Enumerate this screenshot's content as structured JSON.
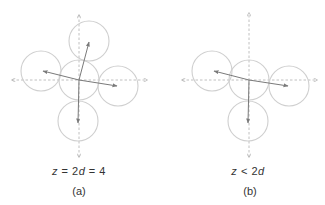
{
  "colors": {
    "axis": "#b0b0b0",
    "circle": "#cfcfcf",
    "arrow": "#7a7a7a",
    "text": "#333333"
  },
  "panels": [
    {
      "id": "a",
      "caption": "(a)",
      "equation": "z  =  2d  =  4",
      "equation_parts": [
        "z",
        " = ",
        "2",
        "d",
        " = ",
        "4"
      ],
      "axes": {
        "cx": 79,
        "cy": 80,
        "x_min": 12,
        "x_max": 147,
        "y_min": 15,
        "y_max": 157
      },
      "radius": 20,
      "circles": [
        {
          "name": "center",
          "cx": 79,
          "cy": 80
        },
        {
          "name": "top",
          "cx": 89,
          "cy": 41
        },
        {
          "name": "left",
          "cx": 41,
          "cy": 71
        },
        {
          "name": "right",
          "cx": 118,
          "cy": 86
        },
        {
          "name": "bottom",
          "cx": 78,
          "cy": 121
        }
      ],
      "vectors": [
        {
          "to": "top",
          "x2": 89,
          "y2": 42
        },
        {
          "to": "left",
          "x2": 43,
          "y2": 71
        },
        {
          "to": "right",
          "x2": 117,
          "y2": 86
        },
        {
          "to": "bottom",
          "x2": 78,
          "y2": 123
        }
      ]
    },
    {
      "id": "b",
      "caption": "(b)",
      "equation": "z < 2d",
      "equation_parts": [
        "z",
        " < ",
        "2",
        "d"
      ],
      "axes": {
        "cx": 249,
        "cy": 80,
        "x_min": 182,
        "x_max": 317,
        "y_min": 13,
        "y_max": 157
      },
      "radius": 20,
      "circles": [
        {
          "name": "center",
          "cx": 249,
          "cy": 80
        },
        {
          "name": "left",
          "cx": 212,
          "cy": 71
        },
        {
          "name": "right",
          "cx": 289,
          "cy": 86
        },
        {
          "name": "bottom",
          "cx": 248,
          "cy": 121
        }
      ],
      "vectors": [
        {
          "to": "left",
          "x2": 214,
          "y2": 71
        },
        {
          "to": "right",
          "x2": 288,
          "y2": 86
        },
        {
          "to": "bottom",
          "x2": 248,
          "y2": 123
        }
      ]
    }
  ]
}
